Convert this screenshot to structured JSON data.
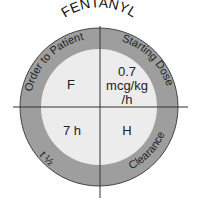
{
  "title": "FENTANYL",
  "ring_labels": {
    "top_left": "Order to Patient",
    "top_right": "Starting Dose",
    "bottom_left": "t ½",
    "bottom_right": "Clearance"
  },
  "quadrants": {
    "top_left": "F",
    "top_right": [
      "0.7",
      "mcg/kg",
      "/h"
    ],
    "bottom_left": "7 h",
    "bottom_right": "H"
  },
  "colors": {
    "ring": "#9e9e9e",
    "inner": "#ececec",
    "line": "#333333",
    "text": "#222222"
  }
}
